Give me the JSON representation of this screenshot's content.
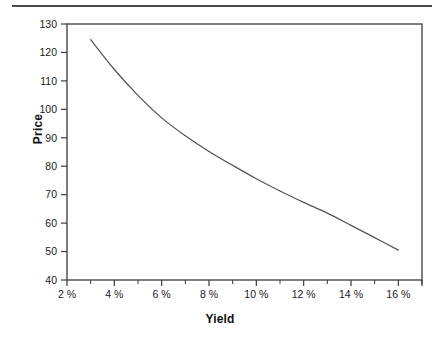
{
  "chart_data": {
    "type": "line",
    "title": "",
    "xlabel": "Yield",
    "ylabel": "Price",
    "xlim": [
      2,
      17
    ],
    "ylim": [
      40,
      130
    ],
    "grid": false,
    "legend": null,
    "x_tick_labels": [
      "2 %",
      "4 %",
      "6 %",
      "8 %",
      "10 %",
      "12 %",
      "14 %",
      "16 %"
    ],
    "x_tick_values": [
      2,
      4,
      6,
      8,
      10,
      12,
      14,
      16
    ],
    "x_minor_tick_values": [
      3,
      5,
      7,
      9,
      11,
      13,
      15,
      17
    ],
    "y_tick_labels": [
      "40",
      "50",
      "60",
      "70",
      "80",
      "90",
      "100",
      "110",
      "120",
      "130"
    ],
    "y_tick_values": [
      40,
      50,
      60,
      70,
      80,
      90,
      100,
      110,
      120,
      130
    ],
    "x": [
      3,
      4,
      5,
      6,
      7,
      8,
      9,
      10,
      11,
      12,
      13,
      14,
      15,
      16
    ],
    "values": [
      124.5,
      114.0,
      104.9,
      97.0,
      90.7,
      85.2,
      80.3,
      75.6,
      71.3,
      67.3,
      63.5,
      59.2,
      54.9,
      50.5
    ],
    "series": [
      {
        "name": "Price-Yield Curve",
        "values": [
          124.5,
          114.0,
          104.9,
          97.0,
          90.7,
          85.2,
          80.3,
          75.6,
          71.3,
          67.3,
          63.5,
          59.2,
          54.9,
          50.5
        ]
      }
    ]
  },
  "axes": {
    "y_title": "Price",
    "x_title": "Yield"
  },
  "colors": {
    "curve": "#555555",
    "frame": "#3c3c3c",
    "rule": "#4a4a4a",
    "text": "#111111",
    "background": "#ffffff"
  }
}
